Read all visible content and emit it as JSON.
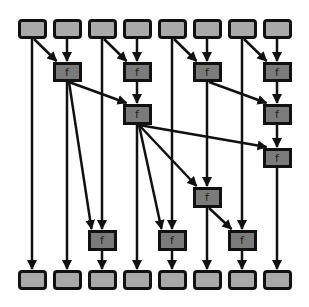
{
  "diagram": {
    "title": "",
    "type": "parallel-prefix-scan",
    "colors": {
      "io_fill": "#a9a9a9",
      "op_fill": "#7b7b7b",
      "stroke": "#111111",
      "background": "#ffffff"
    },
    "op_label": "f",
    "columns_x": [
      32,
      67,
      102,
      137,
      172,
      207,
      242,
      277
    ],
    "rows": {
      "top": [
        19,
        39
      ],
      "L1": [
        62,
        82
      ],
      "L2": [
        104,
        125
      ],
      "L3": [
        148,
        168
      ],
      "L4": [
        187,
        208
      ],
      "L5": [
        230,
        251
      ],
      "bottom": [
        270,
        290
      ]
    },
    "nodes": [
      {
        "id": "t1",
        "kind": "io",
        "col": 0,
        "row": "top"
      },
      {
        "id": "t2",
        "kind": "io",
        "col": 1,
        "row": "top"
      },
      {
        "id": "t3",
        "kind": "io",
        "col": 2,
        "row": "top"
      },
      {
        "id": "t4",
        "kind": "io",
        "col": 3,
        "row": "top"
      },
      {
        "id": "t5",
        "kind": "io",
        "col": 4,
        "row": "top"
      },
      {
        "id": "t6",
        "kind": "io",
        "col": 5,
        "row": "top"
      },
      {
        "id": "t7",
        "kind": "io",
        "col": 6,
        "row": "top"
      },
      {
        "id": "t8",
        "kind": "io",
        "col": 7,
        "row": "top"
      },
      {
        "id": "f2a",
        "kind": "op",
        "col": 1,
        "row": "L1",
        "label": "f"
      },
      {
        "id": "f4a",
        "kind": "op",
        "col": 3,
        "row": "L1",
        "label": "f"
      },
      {
        "id": "f6a",
        "kind": "op",
        "col": 5,
        "row": "L1",
        "label": "f"
      },
      {
        "id": "f8a",
        "kind": "op",
        "col": 7,
        "row": "L1",
        "label": "f"
      },
      {
        "id": "f4b",
        "kind": "op",
        "col": 3,
        "row": "L2",
        "label": "f"
      },
      {
        "id": "f8b",
        "kind": "op",
        "col": 7,
        "row": "L2",
        "label": "f"
      },
      {
        "id": "f8c",
        "kind": "op",
        "col": 7,
        "row": "L3",
        "label": "f"
      },
      {
        "id": "f6d",
        "kind": "op",
        "col": 5,
        "row": "L4",
        "label": "f"
      },
      {
        "id": "f3e",
        "kind": "op",
        "col": 2,
        "row": "L5",
        "label": "f"
      },
      {
        "id": "f5e",
        "kind": "op",
        "col": 4,
        "row": "L5",
        "label": "f"
      },
      {
        "id": "f7e",
        "kind": "op",
        "col": 6,
        "row": "L5",
        "label": "f"
      },
      {
        "id": "b1",
        "kind": "io",
        "col": 0,
        "row": "bottom"
      },
      {
        "id": "b2",
        "kind": "io",
        "col": 1,
        "row": "bottom"
      },
      {
        "id": "b3",
        "kind": "io",
        "col": 2,
        "row": "bottom"
      },
      {
        "id": "b4",
        "kind": "io",
        "col": 3,
        "row": "bottom"
      },
      {
        "id": "b5",
        "kind": "io",
        "col": 4,
        "row": "bottom"
      },
      {
        "id": "b6",
        "kind": "io",
        "col": 5,
        "row": "bottom"
      },
      {
        "id": "b7",
        "kind": "io",
        "col": 6,
        "row": "bottom"
      },
      {
        "id": "b8",
        "kind": "io",
        "col": 7,
        "row": "bottom"
      }
    ],
    "edges": [
      [
        "t1",
        "f2a"
      ],
      [
        "t2",
        "f2a"
      ],
      [
        "t3",
        "f4a"
      ],
      [
        "t4",
        "f4a"
      ],
      [
        "t5",
        "f6a"
      ],
      [
        "t6",
        "f6a"
      ],
      [
        "t7",
        "f8a"
      ],
      [
        "t8",
        "f8a"
      ],
      [
        "f2a",
        "f4b"
      ],
      [
        "f4a",
        "f4b"
      ],
      [
        "f6a",
        "f8b"
      ],
      [
        "f8a",
        "f8b"
      ],
      [
        "f4b",
        "f8c"
      ],
      [
        "f8b",
        "f8c"
      ],
      [
        "f4b",
        "f6d"
      ],
      [
        "f6a",
        "f6d"
      ],
      [
        "f2a",
        "f3e"
      ],
      [
        "t3",
        "f3e"
      ],
      [
        "f4b",
        "f5e"
      ],
      [
        "t5",
        "f5e"
      ],
      [
        "f6d",
        "f7e"
      ],
      [
        "t7",
        "f7e"
      ],
      [
        "t1",
        "b1"
      ],
      [
        "f2a",
        "b2"
      ],
      [
        "f3e",
        "b3"
      ],
      [
        "f4b",
        "b4"
      ],
      [
        "f5e",
        "b5"
      ],
      [
        "f6d",
        "b6"
      ],
      [
        "f7e",
        "b7"
      ],
      [
        "f8c",
        "b8"
      ]
    ]
  }
}
